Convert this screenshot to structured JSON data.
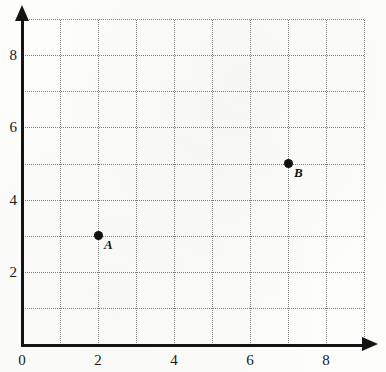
{
  "chart_data": {
    "type": "scatter",
    "title": "",
    "xlabel": "",
    "ylabel": "",
    "xlim": [
      0,
      9
    ],
    "ylim": [
      0,
      9
    ],
    "grid": true,
    "grid_step": 1,
    "legend": "none",
    "x_ticks": [
      {
        "value": 0,
        "label": "0"
      },
      {
        "value": 2,
        "label": "2"
      },
      {
        "value": 4,
        "label": "4"
      },
      {
        "value": 6,
        "label": "6"
      },
      {
        "value": 8,
        "label": "8"
      }
    ],
    "y_ticks": [
      {
        "value": 2,
        "label": "2"
      },
      {
        "value": 4,
        "label": "4"
      },
      {
        "value": 6,
        "label": "6"
      },
      {
        "value": 8,
        "label": "8"
      }
    ],
    "points": [
      {
        "label": "A",
        "x": 2,
        "y": 3
      },
      {
        "label": "B",
        "x": 7,
        "y": 5
      }
    ],
    "colors": {
      "point": "#111111",
      "axis": "#141414",
      "grid": "#7c7c7c",
      "background": "#fdfdfc",
      "text": "#1a1a1a"
    }
  }
}
